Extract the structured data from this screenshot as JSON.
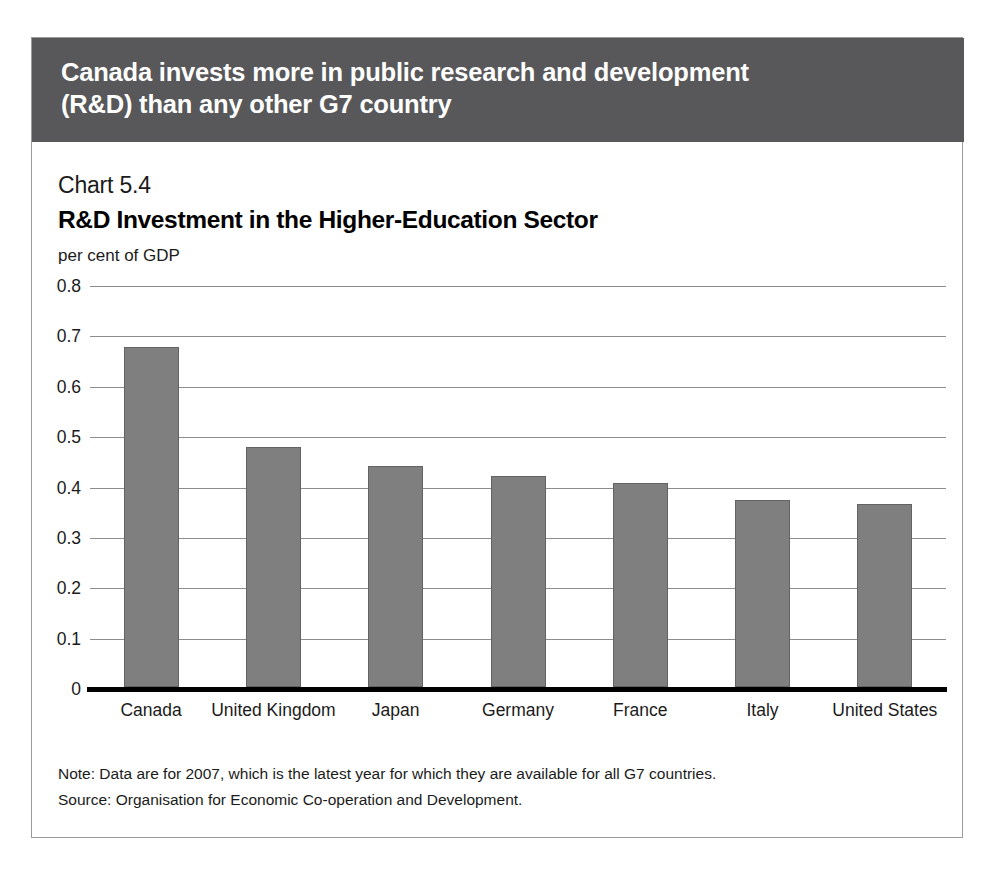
{
  "banner": {
    "headline": "Canada invests more in public research and development (R&D) than any other G7 country"
  },
  "chart_data": {
    "type": "bar",
    "chart_number": "Chart 5.4",
    "title": "R&D Investment in the Higher-Education Sector",
    "ylabel": "per cent of GDP",
    "xlabel": "",
    "categories": [
      "Canada",
      "United Kingdom",
      "Japan",
      "Germany",
      "France",
      "Italy",
      "United States"
    ],
    "values": [
      0.675,
      0.477,
      0.438,
      0.418,
      0.405,
      0.371,
      0.364
    ],
    "ylim": [
      0,
      0.8
    ],
    "ytick_labels": [
      "0.8",
      "0.7",
      "0.6",
      "0.5",
      "0.4",
      "0.3",
      "0.2",
      "0.1",
      "0"
    ],
    "ytick_values": [
      0.8,
      0.7,
      0.6,
      0.5,
      0.4,
      0.3,
      0.2,
      0.1,
      0
    ],
    "grid": true,
    "legend": false,
    "bar_color": "#7f7f80",
    "banner_color": "#58585a"
  },
  "notes": {
    "note": "Note: Data are for 2007, which is the latest year for which they are available for all G7 countries.",
    "source": "Source: Organisation for Economic Co-operation and Development."
  }
}
